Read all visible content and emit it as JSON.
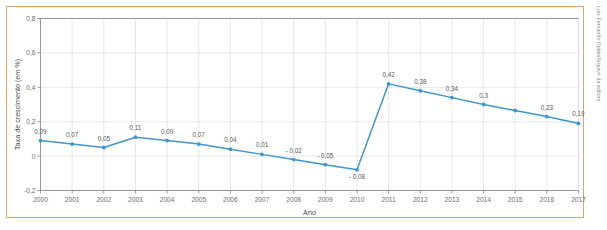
{
  "credit": "Luiz Fernando Rubio/Arquivo da editora",
  "colors": {
    "frame": "#e8a061",
    "series": "#3d96d2",
    "grid": "#d8d8d8",
    "axis": "#8c8c8c",
    "label_text": "#5a5a5a"
  },
  "chart_data": {
    "type": "line",
    "title": "",
    "xlabel": "Ano",
    "ylabel": "Taxa de crescimento (em %)",
    "categories": [
      "2000",
      "2001",
      "2002",
      "2003",
      "2004",
      "2005",
      "2006",
      "2007",
      "2008",
      "2009",
      "2010",
      "2011",
      "2012",
      "2013",
      "2014",
      "2015",
      "2016",
      "2017"
    ],
    "values": [
      0.09,
      0.07,
      0.05,
      0.11,
      0.09,
      0.07,
      0.04,
      0.01,
      -0.02,
      -0.05,
      -0.08,
      0.42,
      0.38,
      0.34,
      0.3,
      0.265,
      0.23,
      0.19
    ],
    "point_labels": [
      "0,09",
      "0,07",
      "0,05",
      "0,11",
      "0,09",
      "0,07",
      "0,04",
      "0,01",
      "- 0,02",
      "- 0,05",
      "- 0,08",
      "0,42",
      "0,38",
      "0,34",
      "0,3",
      "",
      "0,23",
      "0,19"
    ],
    "label_visible": [
      true,
      true,
      true,
      true,
      true,
      true,
      true,
      true,
      true,
      true,
      true,
      true,
      true,
      true,
      true,
      false,
      true,
      true
    ],
    "label_offsets_y": [
      -7,
      -7,
      -7,
      -7,
      -7,
      -7,
      -7,
      -7,
      -7,
      -7,
      9,
      -7,
      -7,
      -7,
      -7,
      0,
      -7,
      -7
    ],
    "ylim": [
      -0.2,
      0.8
    ],
    "yticks": [
      -0.2,
      0,
      0.2,
      0.4,
      0.6,
      0.8
    ],
    "ytick_labels": [
      "-0,2",
      "0",
      "0,2",
      "0,4",
      "0,6",
      "0,8"
    ],
    "grid": true,
    "legend": "none",
    "marker": "circle"
  }
}
